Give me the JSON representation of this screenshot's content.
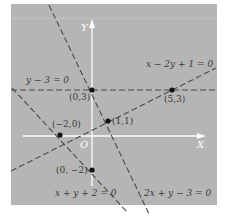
{
  "diagram": {
    "type": "coordinate-plane",
    "background_color": "#b4b4b4",
    "axis_color": "#ffffff",
    "line_color": "#4a4a4a",
    "point_color": "#111111",
    "axes": {
      "x_label": "X",
      "y_label": "Y",
      "origin_label": "O"
    },
    "lines": [
      {
        "equation": "y-3=0",
        "label": "y − 3 = 0"
      },
      {
        "equation": "x-2y+1=0",
        "label": "x − 2y + 1 = 0"
      },
      {
        "equation": "x+y+2=0",
        "label": "x + y + 2 = 0"
      },
      {
        "equation": "2x+y-3=0",
        "label": "2x + y − 3 = 0"
      }
    ],
    "points": [
      {
        "coords": [
          0,
          3
        ],
        "label": "(0,3)"
      },
      {
        "coords": [
          5,
          3
        ],
        "label": "(5,3)"
      },
      {
        "coords": [
          1,
          1
        ],
        "label": "(1,1)"
      },
      {
        "coords": [
          -2,
          0
        ],
        "label": "(−2,0)"
      },
      {
        "coords": [
          0,
          -2
        ],
        "label": "(0, −2)"
      }
    ]
  }
}
